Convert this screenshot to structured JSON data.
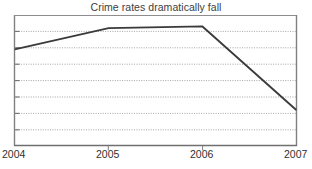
{
  "chart_data": {
    "type": "line",
    "title": "Crime rates dramatically fall",
    "xlabel": "",
    "ylabel": "",
    "categories": [
      "2004",
      "2005",
      "2006",
      "2007"
    ],
    "x": [
      2004,
      2005,
      2006,
      2007
    ],
    "values": [
      5.9,
      7.2,
      7.3,
      2.2
    ],
    "series": [
      {
        "name": "Crime rate",
        "values": [
          5.9,
          7.2,
          7.3,
          2.2
        ]
      }
    ],
    "xlim": [
      2004,
      2007
    ],
    "ylim": [
      0,
      8
    ],
    "y_gridlines": [
      1,
      2,
      3,
      4,
      5,
      6,
      7
    ],
    "y_tick_labels": [],
    "grid": true,
    "grid_style": "dotted-horizontal",
    "legend": false,
    "legend_position": "none",
    "annotations": [],
    "line_color": "#3a3a3a",
    "grid_color": "#9a9a9a",
    "axis_color": "#808080",
    "background_color": "#ffffff"
  },
  "axes": {
    "x_ticks": [
      {
        "label": "2004",
        "value": 2004
      },
      {
        "label": "2005",
        "value": 2005
      },
      {
        "label": "2006",
        "value": 2006
      },
      {
        "label": "2007",
        "value": 2007
      }
    ]
  }
}
